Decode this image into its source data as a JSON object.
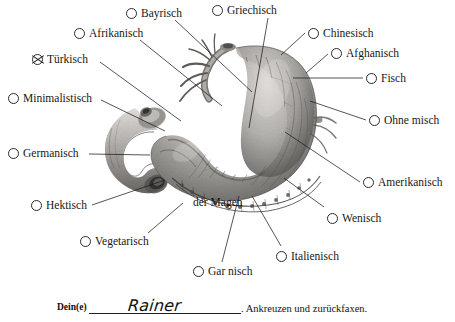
{
  "document": {
    "title": "Der Magen - Ankreuzformular",
    "background_color": "#ffffff",
    "ink_color": "#141414"
  },
  "diagram": {
    "caption": "der Magen"
  },
  "options": [
    {
      "label": "Bayrisch",
      "checked": false,
      "x": 126,
      "y": 8
    },
    {
      "label": "Griechisch",
      "checked": false,
      "x": 212,
      "y": 5
    },
    {
      "label": "Afrikanisch",
      "checked": false,
      "x": 74,
      "y": 28
    },
    {
      "label": "Chinesisch",
      "checked": false,
      "x": 308,
      "y": 28
    },
    {
      "label": "Afghanisch",
      "checked": false,
      "x": 331,
      "y": 48
    },
    {
      "label": "Türkisch",
      "checked": true,
      "x": 32,
      "y": 54
    },
    {
      "label": "Fisch",
      "checked": false,
      "x": 366,
      "y": 73
    },
    {
      "label": "Minimalistisch",
      "checked": false,
      "x": 8,
      "y": 93
    },
    {
      "label": "Ohne misch",
      "checked": false,
      "x": 369,
      "y": 115
    },
    {
      "label": "Germanisch",
      "checked": false,
      "x": 8,
      "y": 148
    },
    {
      "label": "Amerikanisch",
      "checked": false,
      "x": 363,
      "y": 177
    },
    {
      "label": "Hektisch",
      "checked": false,
      "x": 31,
      "y": 200
    },
    {
      "label": "Wenisch",
      "checked": false,
      "x": 327,
      "y": 213
    },
    {
      "label": "Vegetarisch",
      "checked": false,
      "x": 80,
      "y": 236
    },
    {
      "label": "Italienisch",
      "checked": false,
      "x": 276,
      "y": 251
    },
    {
      "label": "Gar nisch",
      "checked": false,
      "x": 193,
      "y": 266
    }
  ],
  "footer": {
    "prefix_label": "Dein(e)",
    "signature": "Rainer",
    "suffix_text": ". Ankreuzen und zurückfaxen."
  },
  "leaders": [
    {
      "from_option": "Bayrisch",
      "x1": 175,
      "y1": 20,
      "x2": 252,
      "y2": 92
    },
    {
      "from_option": "Griechisch",
      "x1": 268,
      "y1": 18,
      "x2": 249,
      "y2": 128
    },
    {
      "from_option": "Afrikanisch",
      "x1": 140,
      "y1": 40,
      "x2": 222,
      "y2": 106
    },
    {
      "from_option": "Chinesisch",
      "x1": 305,
      "y1": 33,
      "x2": 281,
      "y2": 55
    },
    {
      "from_option": "Afghanisch",
      "x1": 328,
      "y1": 54,
      "x2": 306,
      "y2": 73
    },
    {
      "from_option": "Türkisch",
      "x1": 100,
      "y1": 62,
      "x2": 181,
      "y2": 121
    },
    {
      "from_option": "Fisch",
      "x1": 363,
      "y1": 78,
      "x2": 293,
      "y2": 78
    },
    {
      "from_option": "Minimalistisch",
      "x1": 101,
      "y1": 100,
      "x2": 165,
      "y2": 131
    },
    {
      "from_option": "Ohne misch",
      "x1": 366,
      "y1": 120,
      "x2": 310,
      "y2": 101
    },
    {
      "from_option": "Germanisch",
      "x1": 89,
      "y1": 154,
      "x2": 150,
      "y2": 155
    },
    {
      "from_option": "Amerikanisch",
      "x1": 360,
      "y1": 182,
      "x2": 285,
      "y2": 132
    },
    {
      "from_option": "Hektisch",
      "x1": 92,
      "y1": 205,
      "x2": 165,
      "y2": 180
    },
    {
      "from_option": "Wenisch",
      "x1": 324,
      "y1": 207,
      "x2": 284,
      "y2": 178
    },
    {
      "from_option": "Vegetarisch",
      "x1": 148,
      "y1": 233,
      "x2": 183,
      "y2": 203
    },
    {
      "from_option": "Italienisch",
      "x1": 281,
      "y1": 246,
      "x2": 252,
      "y2": 196
    },
    {
      "from_option": "Gar nisch",
      "x1": 222,
      "y1": 262,
      "x2": 239,
      "y2": 196
    }
  ]
}
